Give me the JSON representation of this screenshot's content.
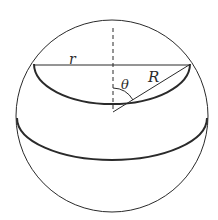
{
  "diagram": {
    "type": "sphere-cap-geometry",
    "labels": {
      "r": "r",
      "R": "R",
      "theta": "θ"
    },
    "colors": {
      "stroke": "#2a2a2a",
      "background": "#ffffff"
    }
  }
}
